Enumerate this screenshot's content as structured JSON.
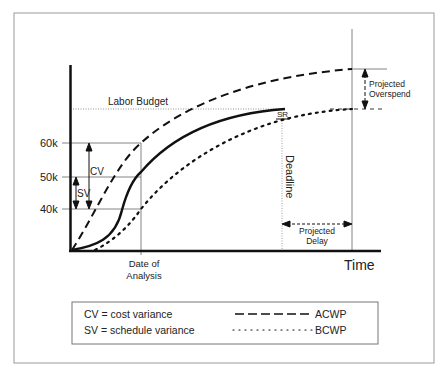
{
  "diagram": {
    "y_ticks": [
      {
        "label": "60k",
        "y": 143
      },
      {
        "label": "50k",
        "y": 177
      },
      {
        "label": "40k",
        "y": 209
      }
    ],
    "labels": {
      "labor_budget": "Labor Budget",
      "cv": "CV",
      "sv": "SV",
      "sr": "SR",
      "deadline": "Deadline",
      "projected_overspend_line1": "Projected",
      "projected_overspend_line2": "Overspend",
      "projected_delay_line1": "Projected",
      "projected_delay_line2": "Delay",
      "date_of_analysis_line1": "Date of",
      "date_of_analysis_line2": "Analysis",
      "x_axis": "Time"
    },
    "legend": {
      "cv_def": "CV = cost variance",
      "sv_def": "SV = schedule variance",
      "acwp": "ACWP",
      "bcwp": "BCWP"
    },
    "colors": {
      "line": "#111111",
      "guide": "#666666",
      "frame": "#9a9a9a"
    }
  }
}
